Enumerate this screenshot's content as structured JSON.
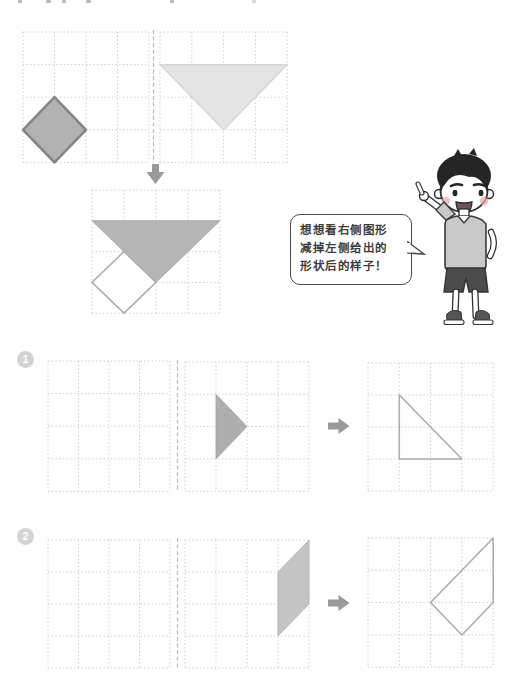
{
  "bubble": {
    "lines": [
      "想想看右侧图形",
      "减掉左侧给出的",
      "形状后的样子！"
    ]
  },
  "badges": [
    {
      "label": "1"
    },
    {
      "label": "2"
    }
  ],
  "palette": {
    "grid_line": "#cbcbcb",
    "divider": "#bdbdbd",
    "arrow": "#9a9a9a",
    "dark_fill": "#b2b2b2",
    "dark_stroke": "#858585",
    "light_fill": "#e3e3e3",
    "mid_fill": "#b5b5b5",
    "outline": "#ababab",
    "badge_bg": "#d3d3d3",
    "badge_text": "#ffffff",
    "bubble_border": "#4a4a4a"
  },
  "scene": {
    "grids": [
      {
        "id": "example-subtrahend-grid",
        "x": 23,
        "y": 32,
        "cols": 4,
        "rows": 4,
        "cw": 31.5,
        "ch": 32.6,
        "shapes": [
          {
            "name": "diamond-shape",
            "points": [
              [
                1,
                2
              ],
              [
                2,
                3
              ],
              [
                1,
                4
              ],
              [
                0,
                3
              ]
            ],
            "fill": "#b2b2b2",
            "stroke": "#858585",
            "sw": 2.6
          }
        ]
      },
      {
        "id": "example-minuend-grid",
        "x": 160,
        "y": 32,
        "cols": 4,
        "rows": 4,
        "cw": 31.8,
        "ch": 32.6,
        "shapes": [
          {
            "name": "big-triangle-shape",
            "points": [
              [
                0,
                1
              ],
              [
                4,
                1
              ],
              [
                2,
                3
              ]
            ],
            "fill": "#e3e3e3",
            "stroke": "#d4d4d4",
            "sw": 1.4
          }
        ]
      },
      {
        "id": "example-result-grid",
        "x": 92,
        "y": 190,
        "cols": 4,
        "rows": 4,
        "cw": 32,
        "ch": 30.8,
        "shapes": [
          {
            "name": "result-triangle-shape",
            "points": [
              [
                0,
                1
              ],
              [
                4,
                1
              ],
              [
                2,
                3
              ]
            ],
            "fill": "#b5b5b5",
            "stroke": "#aeaeae",
            "sw": 1
          },
          {
            "name": "cutout-diamond-outline",
            "points": [
              [
                1,
                2
              ],
              [
                2,
                3
              ],
              [
                1,
                4
              ],
              [
                0,
                3
              ]
            ],
            "fill": "#ffffff",
            "stroke": "#b0b0b0",
            "sw": 1.6
          }
        ]
      },
      {
        "id": "ex1-empty-grid",
        "x": 48,
        "y": 361,
        "cols": 4,
        "rows": 4,
        "cw": 30.5,
        "ch": 32.6,
        "shapes": []
      },
      {
        "id": "ex1-shape-grid",
        "x": 185,
        "y": 362,
        "cols": 4,
        "rows": 4,
        "cw": 31,
        "ch": 32.3,
        "shapes": [
          {
            "name": "small-triangle-shape",
            "points": [
              [
                1,
                1
              ],
              [
                1,
                3
              ],
              [
                2,
                2
              ]
            ],
            "fill": "#aeaeae",
            "stroke": "#a6a6a6",
            "sw": 0.8
          }
        ]
      },
      {
        "id": "ex1-answer-grid",
        "x": 368,
        "y": 363,
        "cols": 4,
        "rows": 4,
        "cw": 31.3,
        "ch": 32,
        "shapes": [
          {
            "name": "answer-triangle-outline",
            "points": [
              [
                1,
                1
              ],
              [
                1,
                3
              ],
              [
                3,
                3
              ]
            ],
            "fill": "none",
            "stroke": "#ababab",
            "sw": 1.5
          }
        ]
      },
      {
        "id": "ex2-empty-grid",
        "x": 48,
        "y": 540,
        "cols": 4,
        "rows": 4,
        "cw": 30.5,
        "ch": 32,
        "shapes": []
      },
      {
        "id": "ex2-shape-grid",
        "x": 185,
        "y": 540,
        "cols": 4,
        "rows": 4,
        "cw": 31,
        "ch": 32,
        "shapes": [
          {
            "name": "parallelogram-shape",
            "points": [
              [
                4,
                0
              ],
              [
                4,
                2
              ],
              [
                3,
                3
              ],
              [
                3,
                1
              ]
            ],
            "fill": "#c4c4c4",
            "stroke": "#bababa",
            "sw": 1
          }
        ]
      },
      {
        "id": "ex2-answer-grid",
        "x": 368,
        "y": 538,
        "cols": 4,
        "rows": 4,
        "cw": 31.3,
        "ch": 32.3,
        "shapes": [
          {
            "name": "answer-quad-outline",
            "points": [
              [
                4,
                0
              ],
              [
                4,
                2
              ],
              [
                3,
                3
              ],
              [
                2,
                2
              ]
            ],
            "fill": "none",
            "stroke": "#ababab",
            "sw": 1.5
          }
        ]
      }
    ],
    "dividers": [
      {
        "name": "example-fold-line",
        "x": 153.5,
        "y1": 30,
        "y2": 163
      },
      {
        "name": "ex1-fold-line",
        "x": 177.5,
        "y1": 360,
        "y2": 492
      },
      {
        "name": "ex2-fold-line",
        "x": 177.5,
        "y1": 538,
        "y2": 668
      }
    ],
    "arrows": [
      {
        "name": "down-arrow-icon",
        "points": [
          [
            152,
            164
          ],
          [
            159,
            164
          ],
          [
            159,
            172
          ],
          [
            164.5,
            172
          ],
          [
            155.5,
            184
          ],
          [
            146.5,
            172
          ],
          [
            152,
            172
          ]
        ]
      },
      {
        "name": "ex1-right-arrow-icon",
        "points": [
          [
            328,
            422.5
          ],
          [
            338.5,
            422.5
          ],
          [
            338.5,
            418
          ],
          [
            349.5,
            426
          ],
          [
            338.5,
            434
          ],
          [
            338.5,
            429.5
          ],
          [
            328,
            429.5
          ]
        ]
      },
      {
        "name": "ex2-right-arrow-icon",
        "points": [
          [
            328,
            599.5
          ],
          [
            338.5,
            599.5
          ],
          [
            338.5,
            595
          ],
          [
            349.5,
            603
          ],
          [
            338.5,
            611
          ],
          [
            338.5,
            606.5
          ],
          [
            328,
            606.5
          ]
        ]
      }
    ]
  }
}
